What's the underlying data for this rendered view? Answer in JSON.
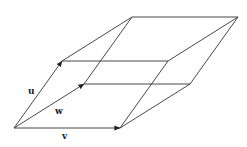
{
  "diagram": {
    "title": "",
    "type": "parallelepiped",
    "stroke_color": "#333333",
    "vectors": [
      {
        "name": "u",
        "label": "u"
      },
      {
        "name": "w",
        "label": "w"
      },
      {
        "name": "v",
        "label": "v"
      }
    ],
    "labels": {
      "u": "u",
      "w": "w",
      "v": "v"
    }
  }
}
